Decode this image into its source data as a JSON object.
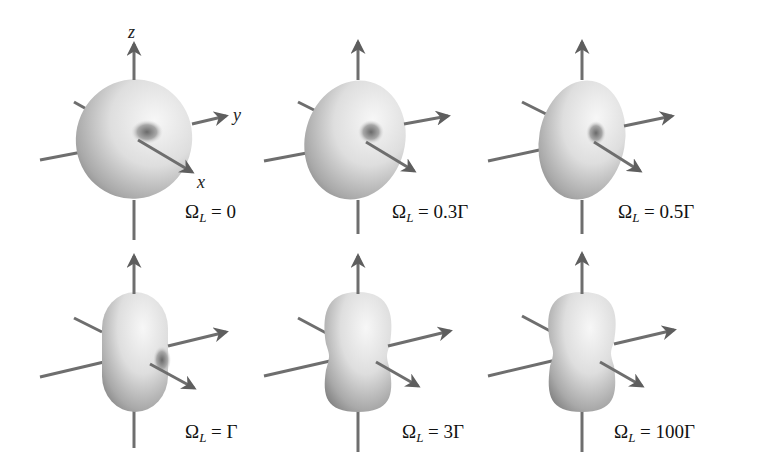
{
  "figure": {
    "axes": {
      "x": "x",
      "y": "y",
      "z": "z"
    },
    "panels": [
      {
        "id": "p1",
        "label_prefix": "Ω",
        "label_sub": "L",
        "label_rest": " = 0",
        "shape": "torus"
      },
      {
        "id": "p2",
        "label_prefix": "Ω",
        "label_sub": "L",
        "label_rest": " = 0.3Γ",
        "shape": "torus-elongated"
      },
      {
        "id": "p3",
        "label_prefix": "Ω",
        "label_sub": "L",
        "label_rest": " = 0.5Γ",
        "shape": "torus-elongated-more"
      },
      {
        "id": "p4",
        "label_prefix": "Ω",
        "label_sub": "L",
        "label_rest": " = Γ",
        "shape": "capsule-dimple"
      },
      {
        "id": "p5",
        "label_prefix": "Ω",
        "label_sub": "L",
        "label_rest": " = 3Γ",
        "shape": "peanut"
      },
      {
        "id": "p6",
        "label_prefix": "Ω",
        "label_sub": "L",
        "label_rest": " = 100Γ",
        "shape": "peanut"
      }
    ],
    "colors": {
      "axis": "#6e6e6e",
      "surface_light": "#f2f2f2",
      "surface_dark": "#8a8a8a",
      "text": "#111111"
    }
  }
}
